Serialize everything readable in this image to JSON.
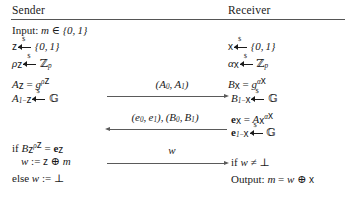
{
  "figure": {
    "type": "protocol-diagram",
    "columns": {
      "left_header": "Sender",
      "right_header": "Receiver"
    },
    "rule_color": "#555555",
    "arrow_color": "#5a5a5a",
    "text_color": "#1a1a1a"
  },
  "sender": {
    "lines": [
      {
        "id": "input",
        "text": "Input: m ∈ {0,1}"
      },
      {
        "id": "z-sample",
        "text": "z ←$ {0,1}"
      },
      {
        "id": "rho-sample",
        "text": "ρz ←$ ℤp"
      },
      {
        "id": "Az",
        "text": "Az = g^{ρz}"
      },
      {
        "id": "A1mz",
        "text": "A1−z ←$ 𝔾"
      },
      {
        "id": "if-check",
        "text": "if Bz^{ρz} = ez"
      },
      {
        "id": "w-assign",
        "text": "w := z ⊕ m"
      },
      {
        "id": "else-bot",
        "text": "else w := ⊥"
      }
    ]
  },
  "receiver": {
    "lines": [
      {
        "id": "x-sample",
        "text": "x ←$ {0,1}"
      },
      {
        "id": "alpha-sample",
        "text": "αx ←$ ℤp"
      },
      {
        "id": "Bx",
        "text": "Bx = g^{αx}"
      },
      {
        "id": "B1mx",
        "text": "B1−x ←$ 𝔾"
      },
      {
        "id": "ex",
        "text": "ex = Ax^{αx}"
      },
      {
        "id": "e1mx",
        "text": "e1−x ←$ 𝔾"
      },
      {
        "id": "if-w",
        "text": "if w ≠ ⊥"
      },
      {
        "id": "output",
        "text": "Output: m = w ⊕ x"
      }
    ]
  },
  "messages": [
    {
      "id": "msg-A",
      "label": "(A0, A1)",
      "direction": "right"
    },
    {
      "id": "msg-eB",
      "label": "(e0, e1), (B0, B1)",
      "direction": "left"
    },
    {
      "id": "msg-w",
      "label": "w",
      "direction": "right"
    }
  ]
}
